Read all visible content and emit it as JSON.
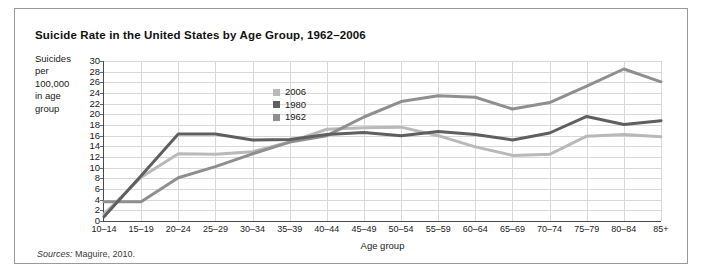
{
  "figure": {
    "title": "Suicide Rate in the United States by Age Group, 1962–2006",
    "source_prefix": "Sources:",
    "source_text": " Maguire, 2010."
  },
  "axis": {
    "y_caption_lines": [
      "Suicides",
      "per",
      "100,000",
      "in age",
      "group"
    ],
    "x_title": "Age group"
  },
  "colors": {
    "series_2006": "#b9b9b9",
    "series_1980": "#5f5f5f",
    "series_1962": "#8f8f8f",
    "gridline": "#d8d8d8",
    "axis": "#4a4a4a",
    "panel_border": "#9a9a9a",
    "text": "#1a1a1a",
    "background": "#ffffff"
  },
  "chart_data": {
    "type": "line",
    "title": "Suicide Rate in the United States by Age Group, 1962–2006",
    "xlabel": "Age group",
    "ylabel": "Suicides per 100,000 in age group",
    "ylim": [
      0,
      30
    ],
    "ytick_step": 2,
    "yticks": [
      0,
      2,
      4,
      6,
      8,
      10,
      12,
      14,
      16,
      18,
      20,
      22,
      24,
      26,
      28,
      30
    ],
    "grid": true,
    "legend_position": "inside-upper-center",
    "categories": [
      "10–14",
      "15–19",
      "20–24",
      "25–29",
      "30–34",
      "35–39",
      "40–44",
      "45–49",
      "50–54",
      "55–59",
      "60–64",
      "65–69",
      "70–74",
      "75–79",
      "80–84",
      "85+"
    ],
    "series": [
      {
        "name": "2006",
        "color": "#b9b9b9",
        "values": [
          1.3,
          8.2,
          12.6,
          12.5,
          13.0,
          14.8,
          17.2,
          17.5,
          17.6,
          16.0,
          13.9,
          12.3,
          12.5,
          15.9,
          16.2,
          15.8
        ]
      },
      {
        "name": "1980",
        "color": "#5f5f5f",
        "values": [
          0.8,
          8.5,
          16.3,
          16.3,
          15.2,
          15.3,
          16.2,
          16.6,
          16.0,
          16.8,
          16.2,
          15.2,
          16.5,
          19.6,
          18.1,
          18.8
        ]
      },
      {
        "name": "1962",
        "color": "#8f8f8f",
        "values": [
          3.6,
          3.6,
          8.1,
          10.2,
          12.6,
          14.8,
          16.0,
          19.5,
          22.4,
          23.5,
          23.2,
          21.0,
          22.2,
          25.3,
          28.5,
          26.1
        ]
      }
    ]
  },
  "legend": {
    "entries": [
      {
        "label": "2006",
        "color": "#b9b9b9"
      },
      {
        "label": "1980",
        "color": "#5f5f5f"
      },
      {
        "label": "1962",
        "color": "#8f8f8f"
      }
    ]
  }
}
